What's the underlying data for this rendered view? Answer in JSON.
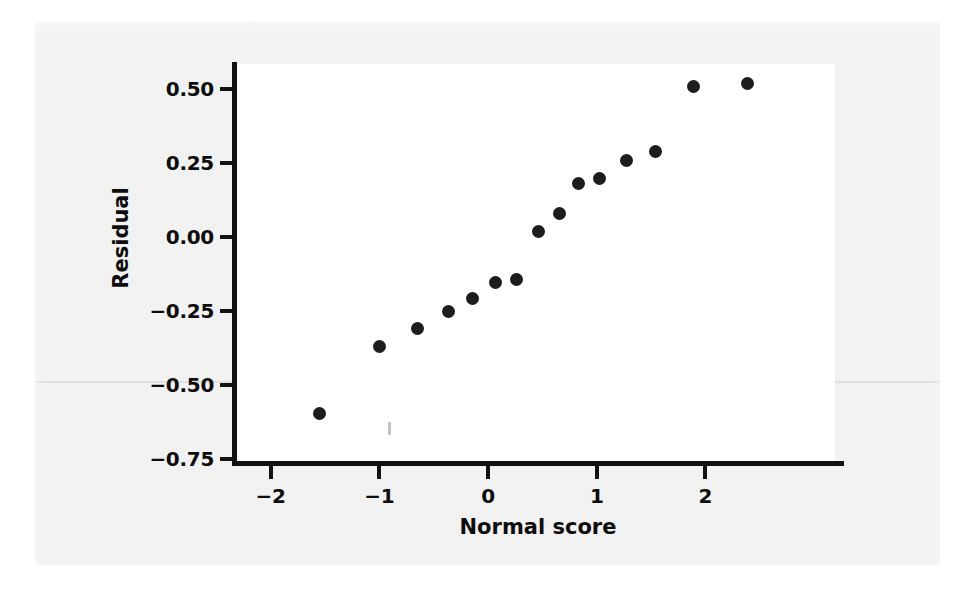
{
  "figure": {
    "kind": "normal-probability-plot",
    "background_color": "#ebebeb",
    "plot_background_color": "#ffffff",
    "ink_color": "#1d1d1d"
  },
  "chart_data": {
    "type": "scatter",
    "title": "",
    "subtitle": "",
    "xlabel": "Normal score",
    "ylabel": "Residual",
    "xlim": [
      -2.35,
      2.3
    ],
    "ylim": [
      -0.79,
      0.62
    ],
    "xticks": [
      -2,
      -1,
      0,
      1,
      2
    ],
    "xticklabels": [
      "−2",
      "−1",
      "0",
      "1",
      "2"
    ],
    "yticks": [
      0.5,
      0.25,
      0,
      -0.25,
      -0.5,
      -0.75
    ],
    "yticklabels": [
      "0.50",
      "0.25",
      "0.00",
      "−0.25",
      "−0.50",
      "−0.75"
    ],
    "grid": false,
    "legend": null,
    "marker": "filled-circle",
    "marker_color": "#1d1d1d",
    "n_points": 16,
    "x": [
      -1.55,
      -1.0,
      -0.65,
      -0.36,
      -0.14,
      0.07,
      0.26,
      0.46,
      0.66,
      0.83,
      1.03,
      1.27,
      1.54,
      1.9,
      2.35,
      3.1
    ],
    "y": [
      -0.595,
      -0.37,
      -0.31,
      -0.253,
      -0.209,
      -0.155,
      -0.145,
      0.017,
      0.078,
      0.182,
      0.196,
      0.257,
      0.29,
      0.507,
      0.52,
      0.52
    ],
    "points": [
      {
        "x": -1.55,
        "y": -0.595
      },
      {
        "x": -1.0,
        "y": -0.37
      },
      {
        "x": -0.65,
        "y": -0.31
      },
      {
        "x": -0.36,
        "y": -0.253
      },
      {
        "x": -0.14,
        "y": -0.209
      },
      {
        "x": 0.07,
        "y": -0.155
      },
      {
        "x": 0.26,
        "y": -0.145
      },
      {
        "x": 0.46,
        "y": 0.017
      },
      {
        "x": 0.66,
        "y": 0.078
      },
      {
        "x": 0.83,
        "y": 0.182
      },
      {
        "x": 1.03,
        "y": 0.196
      },
      {
        "x": 1.27,
        "y": 0.257
      },
      {
        "x": 1.54,
        "y": 0.29
      },
      {
        "x": 1.89,
        "y": 0.507
      },
      {
        "x": 2.39,
        "y": 0.52
      }
    ]
  }
}
